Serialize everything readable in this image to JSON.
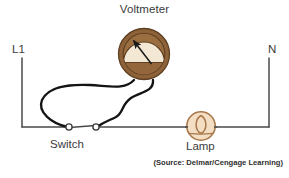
{
  "diagram": {
    "type": "electrical-schematic",
    "canvas": {
      "width": 289,
      "height": 178,
      "background": "#ffffff"
    },
    "labels": {
      "voltmeter": "Voltmeter",
      "line_terminal": "L1",
      "neutral_terminal": "N",
      "switch": "Switch",
      "lamp": "Lamp",
      "source": "(Source: Delmar/Cengage Learning)",
      "bottom_partial": ""
    },
    "colors": {
      "wire": "#1a1a1a",
      "main_line": "#3d3d3d",
      "meter_ring": "#8a6239",
      "meter_ring_dark": "#6f4b2a",
      "meter_face": "#f0e6d2",
      "meter_body": "#8d6338",
      "lamp_outline": "#a8784b",
      "lamp_fill": "#f2dcc2",
      "text": "#3b3b3b",
      "background": "#ffffff"
    },
    "components": [
      {
        "name": "voltmeter",
        "kind": "meter",
        "label": "Voltmeter",
        "cx": 144,
        "cy": 54,
        "outer_radius": 26,
        "inner_radius": 21,
        "needle_angle_deg": 222,
        "leads": 2
      },
      {
        "name": "switch",
        "kind": "spst-switch",
        "label": "Switch",
        "terminal_left_x": 69,
        "terminal_right_x": 96,
        "terminal_y": 127,
        "terminal_radius": 3.1,
        "state": "closed"
      },
      {
        "name": "lamp",
        "kind": "incandescent-lamp",
        "label": "Lamp",
        "cx": 201,
        "cy": 126,
        "radius": 15
      }
    ],
    "nodes": [
      {
        "name": "L1",
        "x": 22,
        "y": 58,
        "label": "L1"
      },
      {
        "name": "N",
        "x": 268,
        "y": 58,
        "label": "N"
      }
    ],
    "wires": [
      {
        "name": "line-drop-left",
        "path": "M22,58 L22,127"
      },
      {
        "name": "bottom-rail",
        "path": "M22,127 L269,127"
      },
      {
        "name": "neutral-drop-right",
        "path": "M269,127 L269,58"
      },
      {
        "name": "meter-lead-left",
        "path": "M135,81 C118,92 60,78 46,100 C38,113 52,124 66,127"
      },
      {
        "name": "meter-lead-right",
        "path": "M152,81 C152,95 114,93 110,106 C106,118 106,122 99,127"
      }
    ]
  }
}
